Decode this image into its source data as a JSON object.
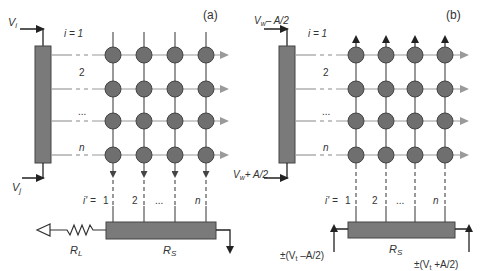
{
  "colors": {
    "node_fill": "#6f6f6f",
    "node_stroke": "#444444",
    "bar_fill": "#7a7a7a",
    "wire": "#555555",
    "arrow_gray": "#9a9a9a",
    "text": "#333333"
  },
  "panel_a": {
    "tag": "(a)",
    "input_top": {
      "V": "V",
      "sub": "i"
    },
    "input_bottom": {
      "V": "V",
      "sub": "j"
    },
    "row_labels": [
      "i = 1",
      "2",
      "...",
      "n"
    ],
    "col_labels_prefix": "i' = ",
    "col_labels": [
      "1",
      "2",
      "...",
      "n"
    ],
    "resistor_L": {
      "R": "R",
      "sub": "L"
    },
    "resistor_S": {
      "R": "R",
      "sub": "S"
    }
  },
  "panel_b": {
    "tag": "(b)",
    "input_top": {
      "V": "V",
      "sub": "w",
      "suffix": "– A/2"
    },
    "input_bottom": {
      "V": "V",
      "sub": "w",
      "suffix": "+ A/2"
    },
    "row_labels": [
      "i = 1",
      "2",
      "...",
      "n"
    ],
    "col_labels_prefix": "i' = ",
    "col_labels": [
      "1",
      "2",
      "...",
      "n"
    ],
    "resistor_S": {
      "R": "R",
      "sub": "S"
    },
    "bias_left": {
      "pre": "±(V",
      "sub": "t",
      "post": " –A/2)"
    },
    "bias_right": {
      "pre": "±(V",
      "sub": "t",
      "post": " +A/2)"
    }
  }
}
